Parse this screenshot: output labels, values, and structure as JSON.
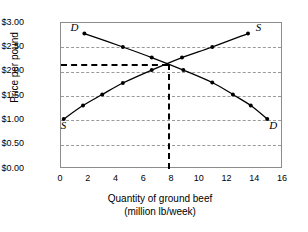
{
  "chart_data": {
    "type": "line",
    "title": "",
    "xlabel": "Quantity of ground beef (million lb/week)",
    "xlabel_line1": "Quantity of ground beef",
    "xlabel_line2": "(million lb/week)",
    "ylabel": "Price per pound",
    "xlim": [
      0,
      16
    ],
    "ylim": [
      0,
      3.0
    ],
    "grid": true,
    "legend_position": "curve-ends",
    "xticks": [
      0,
      2,
      4,
      6,
      8,
      10,
      12,
      14,
      16
    ],
    "xtick_labels": [
      "0",
      "2",
      "4",
      "6",
      "8",
      "10",
      "12",
      "14",
      "16"
    ],
    "yticks": [
      0.0,
      0.5,
      1.0,
      1.5,
      2.0,
      2.5,
      3.0
    ],
    "ytick_labels": [
      "$0.00",
      "$0.50",
      "$1.00",
      "$1.50",
      "$2.00",
      "$2.50",
      "$3.00"
    ],
    "series": [
      {
        "name": "Demand",
        "label": "D",
        "label_start": "D",
        "label_end": "D",
        "marker": "filled-circle",
        "points": [
          {
            "x": 1.7,
            "y": 2.78
          },
          {
            "x": 4.5,
            "y": 2.5
          },
          {
            "x": 6.6,
            "y": 2.28
          },
          {
            "x": 8.9,
            "y": 2.02
          },
          {
            "x": 11.0,
            "y": 1.76
          },
          {
            "x": 12.5,
            "y": 1.51
          },
          {
            "x": 13.8,
            "y": 1.28
          },
          {
            "x": 15.0,
            "y": 1.0
          }
        ]
      },
      {
        "name": "Supply",
        "label": "S",
        "label_start": "S",
        "label_end": "S",
        "marker": "filled-circle",
        "points": [
          {
            "x": 0.2,
            "y": 1.0
          },
          {
            "x": 1.6,
            "y": 1.28
          },
          {
            "x": 3.0,
            "y": 1.51
          },
          {
            "x": 4.5,
            "y": 1.75
          },
          {
            "x": 6.6,
            "y": 2.02
          },
          {
            "x": 8.8,
            "y": 2.28
          },
          {
            "x": 11.0,
            "y": 2.5
          },
          {
            "x": 13.6,
            "y": 2.78
          }
        ]
      }
    ],
    "equilibrium": {
      "x": 7.7,
      "y": 2.15,
      "price_label": "",
      "quantity_label": ""
    },
    "annotations": [
      {
        "text": "D",
        "x": 1.7,
        "y": 2.78,
        "position": "left"
      },
      {
        "text": "S",
        "x": 13.6,
        "y": 2.78,
        "position": "right"
      },
      {
        "text": "S",
        "x": 0.2,
        "y": 1.0,
        "position": "below"
      },
      {
        "text": "D",
        "x": 15.0,
        "y": 1.0,
        "position": "below-right"
      }
    ]
  },
  "colors": {
    "curve": "#000000",
    "gridline": "#9a9a9a",
    "frame": "#8c8c8c",
    "equilibrium_line": "#000000",
    "background": "#ffffff"
  }
}
